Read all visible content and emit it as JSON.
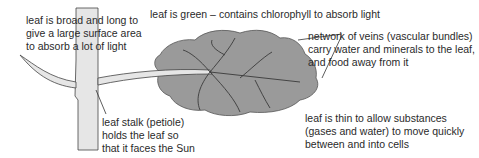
{
  "diagram": {
    "colors": {
      "leaf_fill": "#9a9a9a",
      "stem_fill": "#e6e6e6",
      "outline": "#333333",
      "text": "#2a2a2a"
    },
    "labels": {
      "broad": "leaf is broad and long to\ngive a large surface area\nto absorb a lot of light",
      "green": "leaf is green – contains chlorophyll to absorb light",
      "veins": "network of veins (vascular bundles)\ncarry water and minerals to the leaf,\nand food away from it",
      "stalk": "leaf stalk (petiole)\nholds the leaf so\nthat it faces the Sun",
      "thin": "leaf is thin to allow substances\n(gases and water) to move quickly\nbetween and into cells"
    }
  }
}
